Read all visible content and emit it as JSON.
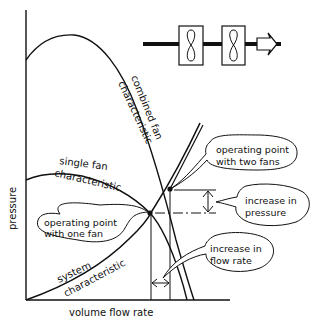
{
  "diagram": {
    "type": "fan-characteristic-curves",
    "axes": {
      "x_label": "volume flow rate",
      "y_label": "pressure"
    },
    "curves": [
      {
        "name": "combined fan characteristic",
        "label_line1": "combined fan",
        "label_line2": "characteristic"
      },
      {
        "name": "single fan characteristic",
        "label_line1": "single fan",
        "label_line2": "characteristic"
      },
      {
        "name": "system characteristic",
        "label_line1": "system",
        "label_line2": "characteristic"
      }
    ],
    "callouts": {
      "one_fan": {
        "line1": "operating point",
        "line2": "with one fan"
      },
      "two_fans": {
        "line1": "operating point",
        "line2": "with two fans"
      },
      "pressure": {
        "line1": "increase in",
        "line2": "pressure"
      },
      "flow": {
        "line1": "increase in",
        "line2": "flow rate"
      }
    },
    "schematic": {
      "description": "two fans in series in a duct with flow arrow",
      "fan_count": 2
    },
    "colors": {
      "ink": "#111111",
      "background": "#ffffff"
    }
  }
}
